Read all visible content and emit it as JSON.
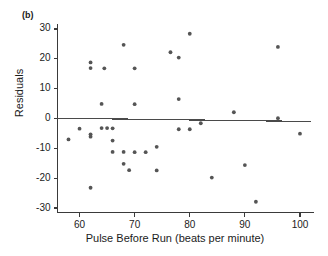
{
  "figure": {
    "panel_label": "(b)",
    "background_color": "#ffffff",
    "ink_color": "#3a3a3a",
    "point_color": "#555555"
  },
  "chart_data": {
    "type": "scatter",
    "title": "",
    "subtitle": "",
    "xlabel": "Pulse Before Run (beats per minute)",
    "ylabel": "Residuals",
    "xlim": [
      56.0,
      102.0
    ],
    "ylim": [
      -31.5,
      31.5
    ],
    "xticks": [
      60,
      70,
      80,
      90,
      100
    ],
    "xtick_labels": [
      "60",
      "70",
      "80",
      "90",
      "100"
    ],
    "yticks": [
      30,
      20,
      10,
      0,
      -10,
      -20,
      -30
    ],
    "ytick_labels": [
      "30",
      "20",
      "10",
      "0",
      "-10",
      "-20",
      "-30"
    ],
    "grid": false,
    "legend": null,
    "legend_position": "none",
    "reference_line": {
      "name": "zero-residual-line",
      "x_start": 56.0,
      "y_start": 0.1,
      "x_end": 102.0,
      "y_end": -1.0,
      "color": "#4a4a4a"
    },
    "marker": {
      "shape": "circle",
      "size_px": 2.6,
      "color": "#555555"
    },
    "x": [
      58,
      60,
      62,
      62,
      62,
      62,
      62,
      64,
      64,
      64.5,
      65,
      66,
      66,
      66,
      68,
      68,
      68,
      69,
      70,
      70,
      70,
      72,
      74,
      74,
      76.5,
      78,
      78,
      78,
      80,
      80,
      82,
      84,
      88,
      90,
      92,
      96,
      96,
      100
    ],
    "y": [
      -7.0,
      -3.4,
      18.8,
      16.9,
      -5.3,
      -6.1,
      -23.2,
      4.9,
      -3.2,
      16.8,
      -3.2,
      -3.3,
      -7.4,
      -11.2,
      24.7,
      -15.2,
      -11.2,
      -17.3,
      16.8,
      4.8,
      -11.3,
      -11.3,
      -9.5,
      -17.4,
      22.2,
      20.4,
      6.5,
      -3.6,
      28.4,
      -3.6,
      -1.6,
      -19.8,
      2.1,
      -15.6,
      -27.9,
      24.0,
      0.1,
      -5.1
    ],
    "n_points": 38,
    "points": [
      {
        "x": 58,
        "y": -7.0
      },
      {
        "x": 60,
        "y": -3.4
      },
      {
        "x": 62,
        "y": 18.8
      },
      {
        "x": 62,
        "y": 16.9
      },
      {
        "x": 62,
        "y": -5.3
      },
      {
        "x": 62,
        "y": -6.1
      },
      {
        "x": 62,
        "y": -23.2
      },
      {
        "x": 64,
        "y": 4.9
      },
      {
        "x": 64,
        "y": -3.2
      },
      {
        "x": 64.5,
        "y": 16.8
      },
      {
        "x": 65,
        "y": -3.2
      },
      {
        "x": 66,
        "y": -3.3
      },
      {
        "x": 66,
        "y": -7.4
      },
      {
        "x": 66,
        "y": -11.2
      },
      {
        "x": 68,
        "y": 24.7
      },
      {
        "x": 68,
        "y": -15.2
      },
      {
        "x": 68,
        "y": -11.2
      },
      {
        "x": 69,
        "y": -17.3
      },
      {
        "x": 70,
        "y": 16.8
      },
      {
        "x": 70,
        "y": 4.8
      },
      {
        "x": 70,
        "y": -11.3
      },
      {
        "x": 72,
        "y": -11.3
      },
      {
        "x": 74,
        "y": -9.5
      },
      {
        "x": 74,
        "y": -17.4
      },
      {
        "x": 76.5,
        "y": 22.2
      },
      {
        "x": 78,
        "y": 20.4
      },
      {
        "x": 78,
        "y": 6.5
      },
      {
        "x": 78,
        "y": -3.6
      },
      {
        "x": 80,
        "y": 28.4
      },
      {
        "x": 80,
        "y": -3.6
      },
      {
        "x": 82,
        "y": -1.6
      },
      {
        "x": 84,
        "y": -19.8
      },
      {
        "x": 88,
        "y": 2.1
      },
      {
        "x": 90,
        "y": -15.6
      },
      {
        "x": 92,
        "y": -27.9
      },
      {
        "x": 96,
        "y": 24.0
      },
      {
        "x": 96,
        "y": 0.1
      },
      {
        "x": 100,
        "y": -5.1
      }
    ]
  }
}
